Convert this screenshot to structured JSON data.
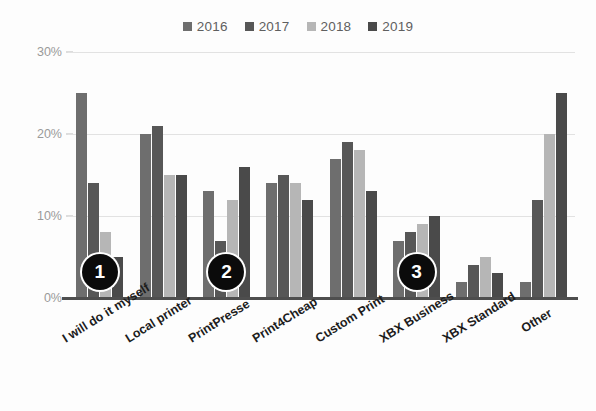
{
  "chart_data": {
    "type": "bar",
    "title": "",
    "subtitle": "",
    "xlabel": "",
    "ylabel": "",
    "ylim": [
      0,
      30
    ],
    "ytick_labels": [
      "0%",
      "10%",
      "20%",
      "30%"
    ],
    "ytick_values": [
      0,
      10,
      20,
      30
    ],
    "grid": true,
    "legend_position": "top-center",
    "categories": [
      "I will do it myself",
      "Local printer",
      "PrintPresse",
      "Print4Cheap",
      "Custom Print",
      "XBX Business",
      "XBX Standard",
      "Other"
    ],
    "series": [
      {
        "name": "2016",
        "color": "#6e6e6e",
        "values": [
          25,
          20,
          13,
          14,
          17,
          7,
          2,
          2
        ]
      },
      {
        "name": "2017",
        "color": "#575757",
        "values": [
          14,
          21,
          7,
          15,
          19,
          8,
          4,
          12
        ]
      },
      {
        "name": "2018",
        "color": "#b6b6b6",
        "values": [
          8,
          15,
          12,
          14,
          18,
          9,
          5,
          20
        ]
      },
      {
        "name": "2019",
        "color": "#4a4a4a",
        "values": [
          5,
          15,
          16,
          12,
          13,
          10,
          3,
          25
        ]
      }
    ],
    "annotations": [
      {
        "label": "1",
        "category": "I will do it myself"
      },
      {
        "label": "2",
        "category": "PrintPresse"
      },
      {
        "label": "3",
        "category": "XBX Business"
      }
    ]
  }
}
